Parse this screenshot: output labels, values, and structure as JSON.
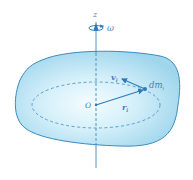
{
  "figure": {
    "colors": {
      "body_fill_center": "#f2fbfe",
      "body_fill_edge": "#a9dcef",
      "outline": "#3a8cc0",
      "axis": "#3a8cc0",
      "dashed_circle": "#4a95c8",
      "vector": "#2f7ab8",
      "label": "#3f7fb8"
    },
    "labels": {
      "axis": "z",
      "angular_velocity": "ω",
      "origin": "O",
      "mass_element": "dm",
      "mass_element_sub": "i",
      "radius_vector": "r",
      "radius_vector_sub": "i",
      "velocity_vector": "v",
      "velocity_vector_sub": "i"
    }
  }
}
